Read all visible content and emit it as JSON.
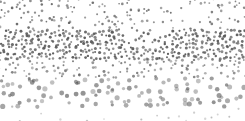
{
  "image": {
    "description": "Halftone dot pattern texture: sparse small dots at top, dense dark band across the middle, larger sparser lighter dots toward the bottom",
    "width": 245,
    "height": 121,
    "background": "#ffffff",
    "dot_color": "#555555",
    "bands": [
      {
        "name": "top-sparse",
        "y_start": 0,
        "y_end": 32,
        "density": 0.35,
        "radius": [
          0.8,
          1.4
        ],
        "opacity": [
          0.5,
          0.85
        ]
      },
      {
        "name": "middle-dense",
        "y_start": 32,
        "y_end": 60,
        "density": 1.0,
        "radius": [
          1.0,
          1.6
        ],
        "opacity": [
          0.6,
          0.95
        ]
      },
      {
        "name": "lower-mid",
        "y_start": 60,
        "y_end": 80,
        "density": 0.45,
        "radius": [
          0.9,
          1.5
        ],
        "opacity": [
          0.4,
          0.75
        ]
      },
      {
        "name": "bottom-large",
        "y_start": 80,
        "y_end": 108,
        "density": 0.25,
        "radius": [
          1.6,
          2.6
        ],
        "opacity": [
          0.35,
          0.65
        ]
      },
      {
        "name": "bottom-edge",
        "y_start": 108,
        "y_end": 121,
        "density": 0.08,
        "radius": [
          0.8,
          1.2
        ],
        "opacity": [
          0.2,
          0.4
        ]
      }
    ]
  }
}
